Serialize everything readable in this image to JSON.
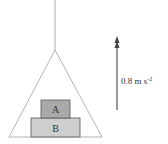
{
  "diagram": {
    "blocks": [
      {
        "label": "A",
        "color": "#a9a9a9",
        "position": "top"
      },
      {
        "label": "B",
        "color": "#cfcfcf",
        "position": "bottom"
      }
    ],
    "acceleration": {
      "value": "0.8 m s",
      "exponent": "-2",
      "direction": "up"
    },
    "colors": {
      "lines": "#888888",
      "arrow": "#555555"
    }
  }
}
